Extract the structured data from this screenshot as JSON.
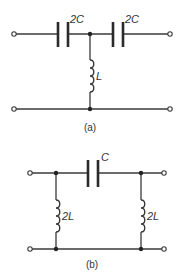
{
  "circuits": [
    {
      "id": "a",
      "caption": "(a)",
      "topology": "T-network high-pass",
      "components": [
        {
          "type": "capacitor",
          "label": "2C",
          "position": "series-left"
        },
        {
          "type": "capacitor",
          "label": "2C",
          "position": "series-right"
        },
        {
          "type": "inductor",
          "label": "L",
          "position": "shunt-center"
        }
      ]
    },
    {
      "id": "b",
      "caption": "(b)",
      "topology": "Pi-network high-pass",
      "components": [
        {
          "type": "capacitor",
          "label": "C",
          "position": "series-center"
        },
        {
          "type": "inductor",
          "label": "2L",
          "position": "shunt-left"
        },
        {
          "type": "inductor",
          "label": "2L",
          "position": "shunt-right"
        }
      ]
    }
  ],
  "colors": {
    "line": "#3a3a3a",
    "background": "#ffffff"
  }
}
